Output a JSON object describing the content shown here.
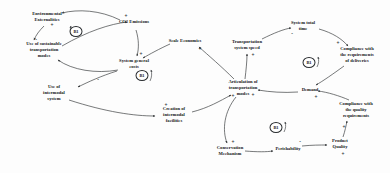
{
  "diagram": {
    "type": "causal-loop-diagram",
    "width": 390,
    "height": 173,
    "background_color": "#fdfdfd",
    "stroke_color": "#2e3133",
    "text_color": "#16181a"
  },
  "nodes": [
    {
      "id": "environmental_externalities",
      "label": "Environmental Externalities",
      "x": 47,
      "y": 17,
      "width_class": "w2"
    },
    {
      "id": "co2_emissions",
      "label": "CO2 Emissions",
      "x": 134,
      "y": 22,
      "width_class": "w3"
    },
    {
      "id": "scale_economies",
      "label": "Scale Economies",
      "x": 185,
      "y": 41,
      "width_class": "w3"
    },
    {
      "id": "transportation_system_speed",
      "label": "Transportation system speed",
      "x": 247,
      "y": 45,
      "width_class": "w3"
    },
    {
      "id": "system_total_time",
      "label": "System total time",
      "x": 303,
      "y": 26,
      "width_class": "w3"
    },
    {
      "id": "compliance_delivery",
      "label": "Compliance with the requirements of deliveries",
      "x": 357,
      "y": 55,
      "width_class": "w3"
    },
    {
      "id": "use_sustainable_modes",
      "label": "Use of sustainable transportation modes",
      "x": 44,
      "y": 50,
      "width_class": "w2"
    },
    {
      "id": "system_general_costs",
      "label": "System general costs",
      "x": 134,
      "y": 64,
      "width_class": "w3"
    },
    {
      "id": "use_intermodal_system",
      "label": "Use of intermodal system",
      "x": 54,
      "y": 93,
      "width_class": "w3"
    },
    {
      "id": "articulation_modes",
      "label": "Articulation of transportation modes",
      "x": 243,
      "y": 88,
      "width_class": "w3"
    },
    {
      "id": "demand",
      "label": "Demand",
      "x": 310,
      "y": 90,
      "width_class": "w4"
    },
    {
      "id": "compliance_quality",
      "label": "Compliance with the quality requirements",
      "x": 356,
      "y": 110,
      "width_class": "w3"
    },
    {
      "id": "creation_intermodal_facilities",
      "label": "Creation of intermodal facilities",
      "x": 174,
      "y": 115,
      "width_class": "w3"
    },
    {
      "id": "conservation_mechanism",
      "label": "Conservation Mechanism",
      "x": 230,
      "y": 151,
      "width_class": "w4"
    },
    {
      "id": "perishability",
      "label": "Perishability",
      "x": 288,
      "y": 149,
      "width_class": "w4"
    },
    {
      "id": "product_quality",
      "label": "Product Quality",
      "x": 340,
      "y": 144,
      "width_class": "w4"
    }
  ],
  "loops": [
    {
      "id": "loop_top_left",
      "label": "B1",
      "x": 77,
      "y": 32
    },
    {
      "id": "loop_center",
      "label": "B1",
      "x": 143,
      "y": 76
    },
    {
      "id": "loop_right",
      "label": "B1",
      "x": 310,
      "y": 63
    },
    {
      "id": "loop_bottom",
      "label": "B1",
      "x": 277,
      "y": 128
    }
  ],
  "signs": [
    {
      "id": "sign_env_ext",
      "label": "+",
      "x": 52,
      "y": 26
    },
    {
      "id": "sign_co2",
      "label": "+",
      "x": 126,
      "y": 17
    },
    {
      "id": "sign_costs_in",
      "label": "+",
      "x": 141,
      "y": 55
    },
    {
      "id": "sign_sustainable",
      "label": "-",
      "x": 36,
      "y": 40
    },
    {
      "id": "sign_intermodal_use",
      "label": "-",
      "x": 98,
      "y": 80
    },
    {
      "id": "sign_scale",
      "label": "+",
      "x": 200,
      "y": 50
    },
    {
      "id": "sign_speed_in",
      "label": "+",
      "x": 253,
      "y": 56
    },
    {
      "id": "sign_total_time",
      "label": "-",
      "x": 292,
      "y": 34
    },
    {
      "id": "sign_compliance_del",
      "label": "+",
      "x": 338,
      "y": 44
    },
    {
      "id": "sign_articulation_a",
      "label": "+",
      "x": 233,
      "y": 97
    },
    {
      "id": "sign_articulation_b",
      "label": "+",
      "x": 253,
      "y": 96
    },
    {
      "id": "sign_facilities",
      "label": "+",
      "x": 166,
      "y": 106
    },
    {
      "id": "sign_demand",
      "label": "+",
      "x": 316,
      "y": 98
    },
    {
      "id": "sign_quality_req",
      "label": "+",
      "x": 344,
      "y": 128
    },
    {
      "id": "sign_conservation",
      "label": "+",
      "x": 233,
      "y": 143
    },
    {
      "id": "sign_perish",
      "label": "-",
      "x": 300,
      "y": 142
    },
    {
      "id": "sign_product_quality",
      "label": "+",
      "x": 343,
      "y": 155
    }
  ],
  "edges": [
    {
      "id": "e_env_to_sustainable",
      "from": "environmental_externalities",
      "to": "use_sustainable_modes",
      "polarity": "-"
    },
    {
      "id": "e_sustainable_to_co2",
      "from": "use_sustainable_modes",
      "to": "co2_emissions",
      "polarity": "-"
    },
    {
      "id": "e_co2_to_env",
      "from": "co2_emissions",
      "to": "environmental_externalities",
      "polarity": "+"
    },
    {
      "id": "e_co2_to_costs",
      "from": "co2_emissions",
      "to": "system_general_costs",
      "polarity": "+"
    },
    {
      "id": "e_scale_to_costs",
      "from": "scale_economies",
      "to": "system_general_costs",
      "polarity": "-"
    },
    {
      "id": "e_costs_to_sustainable",
      "from": "system_general_costs",
      "to": "use_sustainable_modes",
      "polarity": "-"
    },
    {
      "id": "e_costs_to_intermodal",
      "from": "system_general_costs",
      "to": "use_intermodal_system",
      "polarity": "-"
    },
    {
      "id": "e_intermodal_to_facilities",
      "from": "use_intermodal_system",
      "to": "creation_intermodal_facilities",
      "polarity": "+"
    },
    {
      "id": "e_facilities_to_articulation",
      "from": "creation_intermodal_facilities",
      "to": "articulation_modes",
      "polarity": "+"
    },
    {
      "id": "e_articulation_to_scale",
      "from": "articulation_modes",
      "to": "scale_economies",
      "polarity": "+"
    },
    {
      "id": "e_articulation_to_speed",
      "from": "articulation_modes",
      "to": "transportation_system_speed",
      "polarity": "+"
    },
    {
      "id": "e_speed_to_total_time",
      "from": "transportation_system_speed",
      "to": "system_total_time",
      "polarity": "-"
    },
    {
      "id": "e_total_time_to_compliance",
      "from": "system_total_time",
      "to": "compliance_delivery",
      "polarity": "-"
    },
    {
      "id": "e_compliance_to_demand",
      "from": "compliance_delivery",
      "to": "demand",
      "polarity": "+"
    },
    {
      "id": "e_demand_to_articulation",
      "from": "demand",
      "to": "articulation_modes",
      "polarity": "+"
    },
    {
      "id": "e_quality_to_demand",
      "from": "compliance_quality",
      "to": "demand",
      "polarity": "+"
    },
    {
      "id": "e_product_quality_to_compliance",
      "from": "product_quality",
      "to": "compliance_quality",
      "polarity": "+"
    },
    {
      "id": "e_perish_to_product_quality",
      "from": "perishability",
      "to": "product_quality",
      "polarity": "-"
    },
    {
      "id": "e_conservation_to_perish",
      "from": "conservation_mechanism",
      "to": "perishability",
      "polarity": "-"
    },
    {
      "id": "e_articulation_to_conservation",
      "from": "articulation_modes",
      "to": "conservation_mechanism",
      "polarity": "+"
    }
  ]
}
